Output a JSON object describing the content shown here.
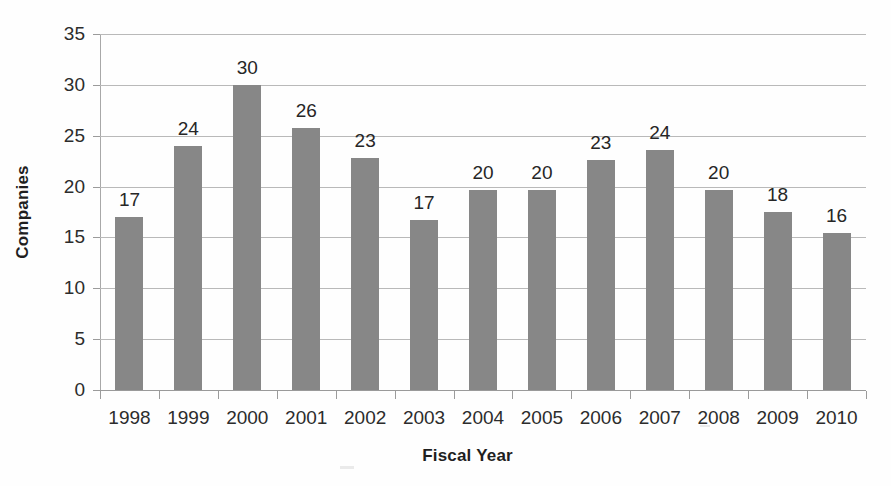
{
  "chart_data": {
    "type": "bar",
    "title": "",
    "xlabel": "Fiscal Year",
    "ylabel": "Companies",
    "categories": [
      "1998",
      "1999",
      "2000",
      "2001",
      "2002",
      "2003",
      "2004",
      "2005",
      "2006",
      "2007",
      "2008",
      "2009",
      "2010"
    ],
    "values": [
      17,
      24,
      30,
      26,
      23,
      17,
      20,
      20,
      23,
      24,
      20,
      18,
      16
    ],
    "plotted_values": [
      17.0,
      24.0,
      30.0,
      25.8,
      22.8,
      16.7,
      19.7,
      19.7,
      22.6,
      23.6,
      19.7,
      17.5,
      15.4
    ],
    "data_labels": [
      "17",
      "24",
      "30",
      "26",
      "23",
      "17",
      "20",
      "20",
      "23",
      "24",
      "20",
      "18",
      "16"
    ],
    "ylim": [
      0,
      35
    ],
    "yticks": [
      0,
      5,
      10,
      15,
      20,
      25,
      30,
      35
    ],
    "ytick_labels": [
      "0",
      "5",
      "10",
      "15",
      "20",
      "25",
      "30",
      "35"
    ],
    "grid": true,
    "legend": false,
    "legend_position": "none",
    "series_color": "#878787",
    "gridline_color": "#b9b9b9",
    "text_color": "#2c2c2c",
    "background_color": "#ffffff"
  },
  "axes": {
    "y_title": "Companies",
    "x_title": "Fiscal Year"
  }
}
